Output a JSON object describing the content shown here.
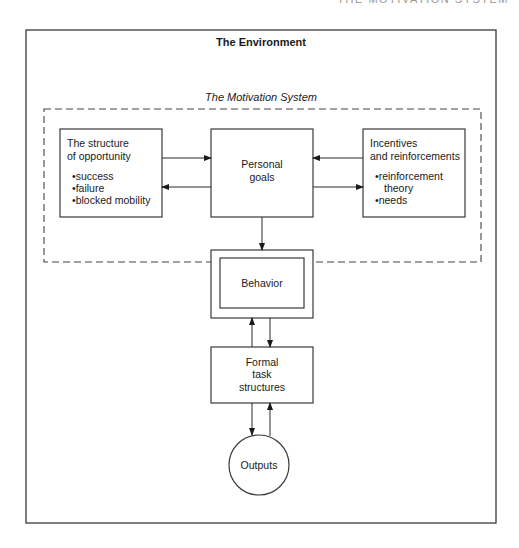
{
  "running_head": "THE MOTIVATION SYSTEM",
  "environment": {
    "title": "The Environment"
  },
  "motivation_system": {
    "title": "The Motivation System",
    "opportunity": {
      "title_lines": [
        "The structure",
        "of opportunity"
      ],
      "bullets": [
        "•success",
        "•failure",
        "•blocked mobility"
      ]
    },
    "goals": {
      "lines": [
        "Personal",
        "goals"
      ]
    },
    "incentives": {
      "title_lines": [
        "Incentives",
        "and reinforcements"
      ],
      "bullets": [
        "•reinforcement",
        "theory",
        "•needs"
      ]
    }
  },
  "behavior": {
    "label": "Behavior"
  },
  "formal_task": {
    "lines": [
      "Formal",
      "task",
      "structures"
    ]
  },
  "outputs": {
    "label": "Outputs"
  },
  "connections": [
    {
      "from": "structure of opportunity",
      "to": "personal goals"
    },
    {
      "from": "personal goals",
      "to": "structure of opportunity"
    },
    {
      "from": "incentives and reinforcements",
      "to": "personal goals"
    },
    {
      "from": "personal goals",
      "to": "incentives and reinforcements"
    },
    {
      "from": "personal goals",
      "to": "behavior"
    },
    {
      "from": "behavior",
      "to": "formal task structures"
    },
    {
      "from": "formal task structures",
      "to": "behavior"
    },
    {
      "from": "formal task structures",
      "to": "outputs"
    },
    {
      "from": "outputs",
      "to": "formal task structures"
    }
  ]
}
